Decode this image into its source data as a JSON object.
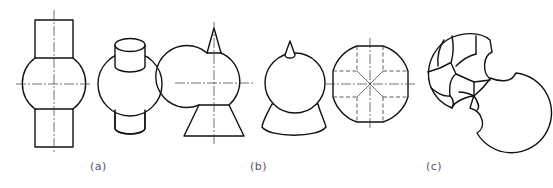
{
  "figure": {
    "line_color": "#111111",
    "centerline_color": "#333333",
    "captions": [
      {
        "id": "a",
        "label": "(a)"
      },
      {
        "id": "b",
        "label": "(b)"
      },
      {
        "id": "c",
        "label": "(c)"
      }
    ],
    "panels": [
      {
        "id": "a",
        "views": [
          "front-view: sphere with coaxial cylinders top and bottom",
          "isometric: sphere with cylinders"
        ]
      },
      {
        "id": "b",
        "views": [
          "front-view: sphere with cone on top and frustum below",
          "isometric: sphere with cone and frustum",
          "top-view: sphere with four perpendicular cylinder cuts (dashed hidden lines)"
        ]
      },
      {
        "id": "c",
        "views": [
          "isometric: two spheres with subtracted cut-outs"
        ]
      }
    ]
  }
}
